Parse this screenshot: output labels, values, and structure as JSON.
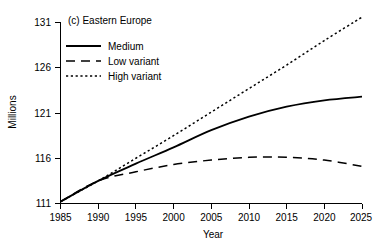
{
  "chart_data": {
    "type": "line",
    "title": "(c) Eastern Europe",
    "xlabel": "Year",
    "ylabel": "Millions",
    "xlim": [
      1985,
      2025
    ],
    "ylim": [
      111,
      131
    ],
    "xticks": [
      1985,
      1990,
      1995,
      2000,
      2005,
      2010,
      2015,
      2020,
      2025
    ],
    "yticks": [
      111,
      116,
      121,
      126,
      131
    ],
    "grid": false,
    "legend_position": "upper-left-inside",
    "x": [
      1985,
      1990,
      1995,
      2000,
      2005,
      2010,
      2015,
      2020,
      2025
    ],
    "series": [
      {
        "name": "Medium",
        "style": "solid",
        "color": "#000000",
        "values": [
          111.2,
          113.5,
          115.4,
          117.2,
          119.1,
          120.6,
          121.7,
          122.4,
          122.8
        ]
      },
      {
        "name": "Low variant",
        "style": "dashed",
        "color": "#000000",
        "values": [
          111.2,
          113.5,
          114.5,
          115.3,
          115.8,
          116.1,
          116.1,
          115.8,
          115.1
        ]
      },
      {
        "name": "High variant",
        "style": "dotted",
        "color": "#000000",
        "values": [
          111.2,
          113.5,
          116.0,
          118.5,
          121.1,
          123.7,
          126.3,
          129.0,
          131.6
        ]
      }
    ]
  },
  "axes": {
    "y_tick_labels": [
      "111",
      "116",
      "121",
      "126",
      "131"
    ],
    "x_tick_labels": [
      "1985",
      "1990",
      "1995",
      "2000",
      "2005",
      "2010",
      "2015",
      "2020",
      "2025"
    ],
    "y_axis_title": "Millions",
    "x_axis_title": "Year"
  },
  "panel": {
    "title": "(c) Eastern Europe"
  },
  "legend": {
    "items": [
      {
        "label": "Medium",
        "style": "solid"
      },
      {
        "label": "Low variant",
        "style": "dashed"
      },
      {
        "label": "High variant",
        "style": "dotted"
      }
    ]
  }
}
